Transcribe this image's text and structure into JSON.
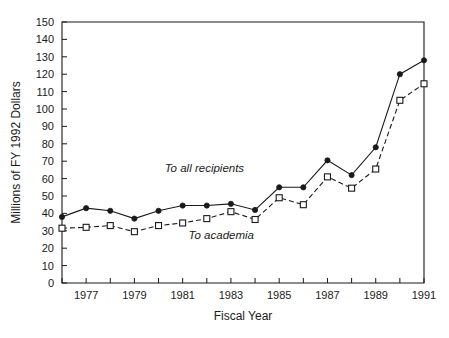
{
  "chart_data": {
    "type": "line",
    "title": "",
    "xlabel": "Fiscal Year",
    "ylabel": "Millions of FY 1992 Dollars",
    "x": [
      1976,
      1977,
      1978,
      1979,
      1980,
      1981,
      1982,
      1983,
      1984,
      1985,
      1986,
      1987,
      1988,
      1989,
      1990,
      1991
    ],
    "xlim": [
      1976,
      1991
    ],
    "ylim": [
      0,
      150
    ],
    "ytick_labels": [
      "0",
      "10",
      "20",
      "30",
      "40",
      "50",
      "60",
      "70",
      "80",
      "90",
      "100",
      "110",
      "120",
      "130",
      "140",
      "150"
    ],
    "ytick_values": [
      0,
      10,
      20,
      30,
      40,
      50,
      60,
      70,
      80,
      90,
      100,
      110,
      120,
      130,
      140,
      150
    ],
    "xtick_values": [
      1976,
      1977,
      1978,
      1979,
      1980,
      1981,
      1982,
      1983,
      1984,
      1985,
      1986,
      1987,
      1988,
      1989,
      1990,
      1991
    ],
    "xtick_labels": [
      "",
      "1977",
      "",
      "1979",
      "",
      "1981",
      "",
      "1983",
      "",
      "1985",
      "",
      "1987",
      "",
      "1989",
      "",
      "1991"
    ],
    "grid": false,
    "legend_position": "inline-annotations",
    "series": [
      {
        "name": "To all recipients",
        "marker": "filled-circle",
        "linestyle": "solid",
        "color": "#1a1a1a",
        "values": [
          38,
          43,
          41.5,
          37,
          41.5,
          44.5,
          44.5,
          45.5,
          42,
          55,
          55,
          70.5,
          62,
          78,
          120,
          128
        ]
      },
      {
        "name": "To academia",
        "marker": "open-square",
        "linestyle": "dashed",
        "color": "#1a1a1a",
        "values": [
          31.5,
          32,
          33,
          29.5,
          33,
          34.5,
          37,
          41,
          36.5,
          49,
          45,
          61,
          54.5,
          65.5,
          105,
          114.5
        ]
      }
    ],
    "annotations": [
      {
        "text": "To all recipients",
        "x": 1981.9,
        "y": 64,
        "style": "italic"
      },
      {
        "text": "To academia",
        "x": 1982.6,
        "y": 25.5,
        "style": "italic"
      }
    ]
  }
}
